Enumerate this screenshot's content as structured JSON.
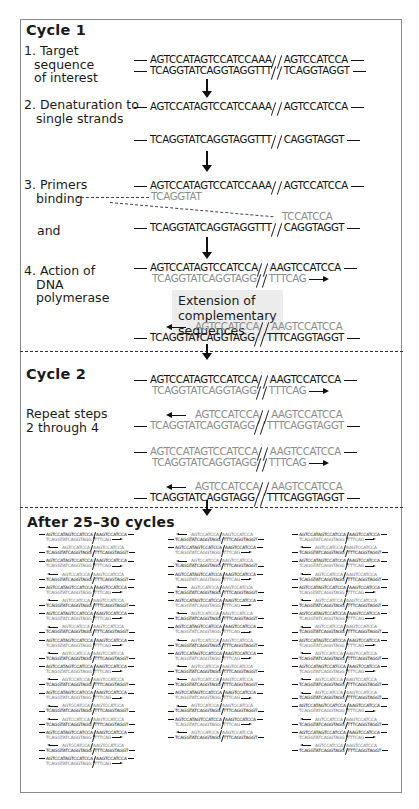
{
  "cycle1": {
    "heading": "Cycle 1",
    "step1": {
      "label_lines": [
        "1. Target",
        "sequence",
        "of interest"
      ],
      "top_left": "AGTCCATAGTCCATCCAAA",
      "top_right": "AGTCCATCCA",
      "bottom_left": "TCAGGTATCAGGTAGGTTT",
      "bottom_right": "TCAGGTAGGT"
    },
    "step2": {
      "label_lines": [
        "2. Denaturation to",
        "single strands"
      ],
      "top_left": "AGTCCATAGTCCATCCAAA",
      "top_right": "AGTCCATCCA",
      "bottom_left": "TCAGGTATCAGGTAGGTTT",
      "bottom_right": "CAGGTAGGT"
    },
    "step3": {
      "label_lines": [
        "3. Primers",
        "binding"
      ],
      "and_label": "and",
      "top_left": "AGTCCATAGTCCATCCAAA",
      "top_right": "AGTCCATCCA",
      "primer1": "TCAGGTAT",
      "primer2": "TCCATCCA",
      "bottom_left": "TCAGGTATCAGGTAGGTTT",
      "bottom_right": "CAGGTAGGT"
    },
    "step4": {
      "label_lines": [
        "4. Action of",
        "DNA",
        "polymerase"
      ],
      "extension_lines": [
        "Extension of",
        "complementary",
        "sequences"
      ],
      "dup1_top_left": "AGTCCATAGTCCATCCA",
      "dup1_top_right": "AAGTCCATCCA",
      "dup1_bottom_left": "TCAGGTATCAGGTAGG",
      "dup1_bottom_right": "TTTCAG",
      "dup2_top_left": "AGTCCATCCA",
      "dup2_top_right": "AAGTCCATCCA",
      "dup2_bottom_left": "TCAGGTATCAGGTAGG",
      "dup2_bottom_right": "TTTCAGGTAGGT"
    }
  },
  "cycle2": {
    "heading": "Cycle 2",
    "label_lines": [
      "Repeat steps",
      "2 through 4"
    ],
    "duplexes": [
      {
        "type": "A",
        "top_left": "AGTCCATAGTCCATCCA",
        "top_right": "AAGTCCATCCA",
        "bottom_left": "TCAGGTATCAGGTAGG",
        "bottom_right": "TTTCAG"
      },
      {
        "type": "B",
        "top_left": "AGTCCATCCA",
        "top_right": "AAGTCCATCCA",
        "bottom_left": "TCAGGTATCAGGTAGG",
        "bottom_right": "TTTCAGGTAGGT"
      },
      {
        "type": "A",
        "top_left": "AGTCCATAGTCCATCCA",
        "top_right": "AAGTCCATCCA",
        "bottom_left": "TCAGGTATCAGGTAGG",
        "bottom_right": "TTTCAG"
      },
      {
        "type": "B",
        "top_left": "AGTCCATCCA",
        "top_right": "AAGTCCATCCA",
        "bottom_left": "TCAGGTATCAGGTAGG",
        "bottom_right": "TTTCAGGTAGGT"
      }
    ]
  },
  "after": {
    "heading": "After  25–30 cycles",
    "mini_A": {
      "top_left": "AGTCCATAGTCCATCCA",
      "top_right": "AAGTCCATCCA",
      "bottom_left": "TCAGGTATCAGGTAGG",
      "bottom_right": "TTTCAG"
    },
    "mini_B": {
      "top_left": "AGTCCATCCA",
      "top_right": "AAGTCCATCCA",
      "bottom_left": "TCAGGTATCAGGTAGG",
      "bottom_right": "TTTCAGGTAGGT"
    },
    "columns": [
      {
        "count": 18,
        "pattern": [
          "A",
          "B",
          "A",
          "B",
          "A",
          "B",
          "A",
          "B",
          "A",
          "B",
          "A",
          "B",
          "A",
          "B",
          "B",
          "A",
          "B",
          "A",
          "B"
        ]
      },
      {
        "count": 16,
        "pattern": [
          "B",
          "A",
          "B",
          "A",
          "B",
          "A",
          "B",
          "A",
          "B",
          "A",
          "B",
          "B",
          "A",
          "B",
          "A",
          "B"
        ]
      },
      {
        "count": 17,
        "pattern": [
          "A",
          "B",
          "A",
          "B",
          "A",
          "B",
          "A",
          "B",
          "A",
          "B",
          "A",
          "B",
          "B",
          "A",
          "B",
          "A",
          "B"
        ]
      }
    ]
  }
}
